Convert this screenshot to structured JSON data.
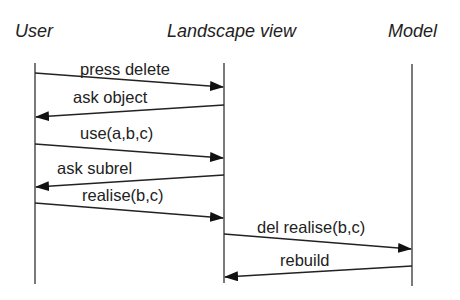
{
  "diagram": {
    "type": "sequence",
    "actors": [
      {
        "id": "user",
        "label": "User",
        "x": 35
      },
      {
        "id": "landscape",
        "label": "Landscape view",
        "x": 224
      },
      {
        "id": "model",
        "label": "Model",
        "x": 412
      }
    ],
    "messages": [
      {
        "label": "press delete",
        "from": "user",
        "to": "landscape"
      },
      {
        "label": "ask object",
        "from": "landscape",
        "to": "user"
      },
      {
        "label": "use(a,b,c)",
        "from": "user",
        "to": "landscape"
      },
      {
        "label": "ask subrel",
        "from": "landscape",
        "to": "user"
      },
      {
        "label": "realise(b,c)",
        "from": "user",
        "to": "landscape"
      },
      {
        "label": "del realise(b,c)",
        "from": "landscape",
        "to": "model"
      },
      {
        "label": "rebuild",
        "from": "model",
        "to": "landscape"
      }
    ]
  }
}
